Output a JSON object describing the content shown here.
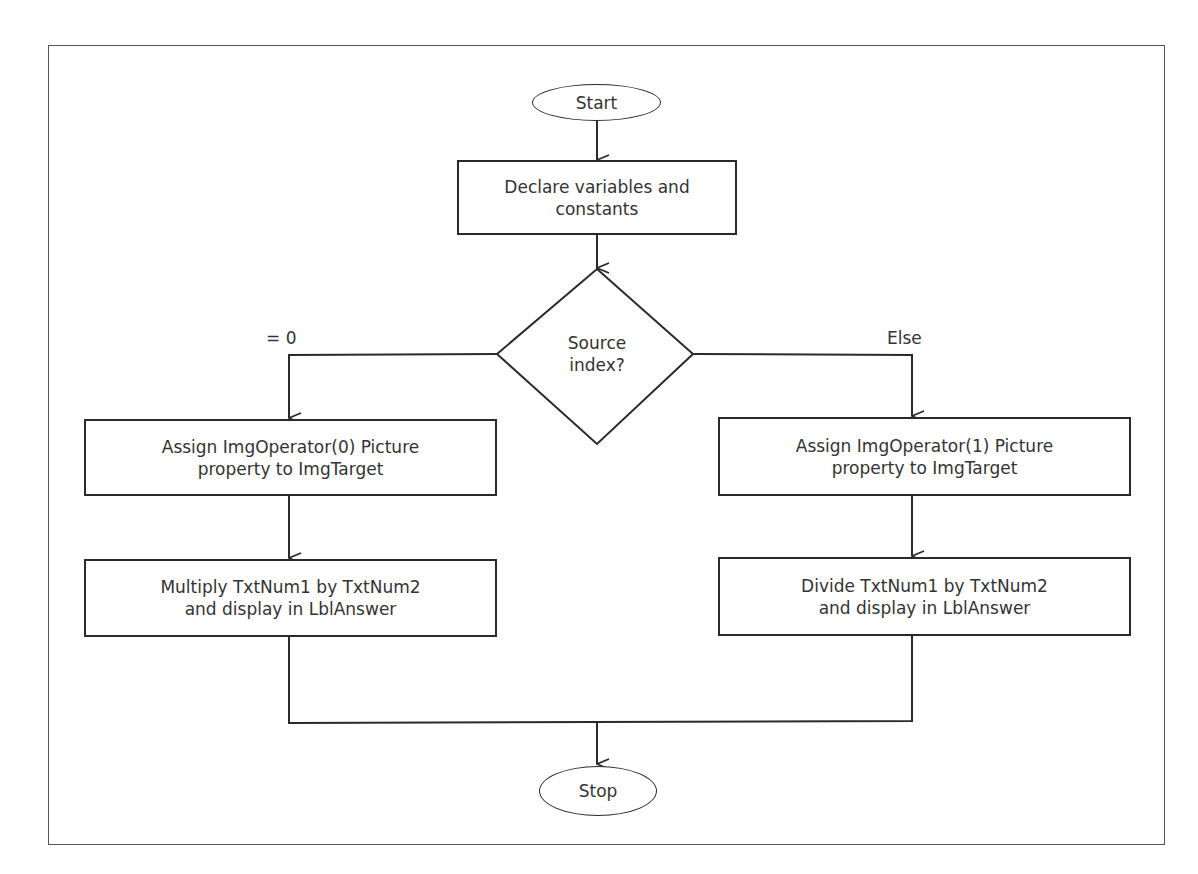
{
  "diagram": {
    "type": "flowchart",
    "nodes": {
      "start": "Start",
      "declare": "Declare variables and\nconstants",
      "decision": "Source\nindex?",
      "assign_left": "Assign ImgOperator(0) Picture\nproperty to ImgTarget",
      "assign_right": "Assign ImgOperator(1) Picture\nproperty to ImgTarget",
      "multiply": "Multiply TxtNum1 by TxtNum2\nand display in LblAnswer",
      "divide": "Divide TxtNum1 by TxtNum2\nand display in LblAnswer",
      "stop": "Stop"
    },
    "edge_labels": {
      "left_branch": "= 0",
      "right_branch": "Else"
    },
    "edges": [
      {
        "from": "start",
        "to": "declare"
      },
      {
        "from": "declare",
        "to": "decision"
      },
      {
        "from": "decision",
        "to": "assign_left",
        "label": "= 0"
      },
      {
        "from": "decision",
        "to": "assign_right",
        "label": "Else"
      },
      {
        "from": "assign_left",
        "to": "multiply"
      },
      {
        "from": "assign_right",
        "to": "divide"
      },
      {
        "from": "multiply",
        "to": "stop"
      },
      {
        "from": "divide",
        "to": "stop"
      }
    ]
  }
}
